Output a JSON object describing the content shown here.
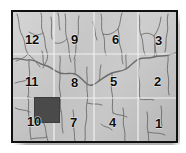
{
  "figure": {
    "kind": "quadrant-grid-map",
    "frame": {
      "left": 11,
      "top": 10,
      "width": 167,
      "height": 133
    },
    "background_color": "#c8c8c8",
    "border_color": "#111111",
    "grid_line_color": "#f2f2f2",
    "stream_color": "#5d5d5d",
    "label_color": "#0d0d0d"
  },
  "grid": {
    "columns": 4,
    "rows": 3,
    "vertical_line_x": [
      41,
      81,
      125
    ],
    "horizontal_line_y": [
      42,
      86
    ]
  },
  "quadrants": [
    {
      "id": "q12",
      "label": "12",
      "row": 1,
      "col": 1,
      "x": 12,
      "y": 21
    },
    {
      "id": "q9",
      "label": "9",
      "row": 1,
      "col": 2,
      "x": 58,
      "y": 21
    },
    {
      "id": "q6",
      "label": "6",
      "row": 1,
      "col": 3,
      "x": 99,
      "y": 21
    },
    {
      "id": "q3",
      "label": "3",
      "row": 1,
      "col": 4,
      "x": 142,
      "y": 22
    },
    {
      "id": "q11",
      "label": "11",
      "row": 2,
      "col": 1,
      "x": 12,
      "y": 63
    },
    {
      "id": "q8",
      "label": "8",
      "row": 2,
      "col": 2,
      "x": 58,
      "y": 64
    },
    {
      "id": "q5",
      "label": "5",
      "row": 2,
      "col": 3,
      "x": 97,
      "y": 63
    },
    {
      "id": "q2",
      "label": "2",
      "row": 2,
      "col": 4,
      "x": 141,
      "y": 63
    },
    {
      "id": "q10",
      "label": "10",
      "row": 3,
      "col": 1,
      "x": 14,
      "y": 103
    },
    {
      "id": "q7",
      "label": "7",
      "row": 3,
      "col": 2,
      "x": 57,
      "y": 104
    },
    {
      "id": "q4",
      "label": "4",
      "row": 3,
      "col": 3,
      "x": 96,
      "y": 104
    },
    {
      "id": "q1",
      "label": "1",
      "row": 3,
      "col": 4,
      "x": 142,
      "y": 105
    }
  ],
  "study_area": {
    "name": "study-area-block",
    "in_quadrant": "10",
    "fill_color": "#4a4a4a",
    "x": 21,
    "y": 85,
    "width": 26,
    "height": 26
  }
}
